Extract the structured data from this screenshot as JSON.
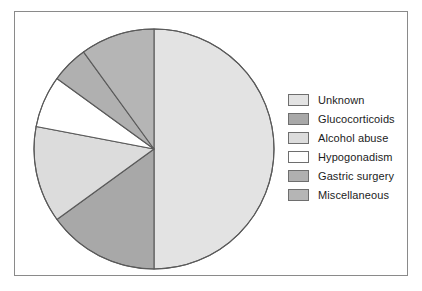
{
  "chart_data": {
    "type": "pie",
    "title": "",
    "legend_position": "right",
    "start_angle_deg": 0,
    "direction": "clockwise",
    "categories": [
      "Unknown",
      "Glucocorticoids",
      "Alcohol abuse",
      "Hypogonadism",
      "Gastric surgery",
      "Miscellaneous"
    ],
    "values": [
      50,
      15,
      13,
      7,
      5,
      10
    ],
    "units": "percent",
    "slices": [
      {
        "label": "Unknown",
        "value": 50,
        "color": "#e3e3e3",
        "start_deg": 0,
        "end_deg": 180
      },
      {
        "label": "Glucocorticoids",
        "value": 15,
        "color": "#a8a8a8",
        "start_deg": 180,
        "end_deg": 234
      },
      {
        "label": "Alcohol abuse",
        "value": 13,
        "color": "#dcdcdc",
        "start_deg": 234,
        "end_deg": 280.8
      },
      {
        "label": "Hypogonadism",
        "value": 7,
        "color": "#ffffff",
        "start_deg": 280.8,
        "end_deg": 306
      },
      {
        "label": "Gastric surgery",
        "value": 5,
        "color": "#b0b0b0",
        "start_deg": 306,
        "end_deg": 324
      },
      {
        "label": "Miscellaneous",
        "value": 10,
        "color": "#b5b5b5",
        "start_deg": 324,
        "end_deg": 360
      }
    ],
    "outline_color": "#5a5a5a",
    "frame_color": "#8a8a8a",
    "background": "#ffffff"
  },
  "legend": {
    "items": [
      {
        "label": "Unknown",
        "color": "#e3e3e3"
      },
      {
        "label": "Glucocorticoids",
        "color": "#a8a8a8"
      },
      {
        "label": "Alcohol abuse",
        "color": "#dcdcdc"
      },
      {
        "label": "Hypogonadism",
        "color": "#ffffff"
      },
      {
        "label": "Gastric surgery",
        "color": "#b0b0b0"
      },
      {
        "label": "Miscellaneous",
        "color": "#b5b5b5"
      }
    ]
  }
}
